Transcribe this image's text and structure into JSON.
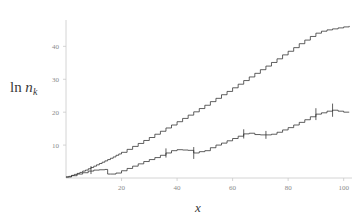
{
  "chart_data": {
    "type": "line",
    "title": "",
    "subtitle": "",
    "xlabel": "x",
    "ylabel": "ln n_k",
    "ylabel_parts": {
      "operator": "ln",
      "variable": "n",
      "subscript": "k"
    },
    "xlim": [
      0,
      103
    ],
    "ylim": [
      0,
      48
    ],
    "xticks": [
      20,
      40,
      60,
      80,
      100
    ],
    "xtick_labels": [
      "20",
      "40",
      "60",
      "80",
      "100"
    ],
    "yticks": [
      10,
      20,
      30,
      40
    ],
    "ytick_labels": [
      "10",
      "20",
      "30",
      "40"
    ],
    "grid": false,
    "legend": "none",
    "axis_color": "#c9c9c9",
    "tick_label_color": "#8a8a8a",
    "curve_color": "#2b2b2b",
    "series": [
      {
        "name": "upper-staircase",
        "style": "step",
        "x": [
          0,
          1,
          2,
          3,
          4,
          5,
          6,
          7,
          8,
          9,
          10,
          11,
          12,
          13,
          14,
          15,
          16,
          17,
          18,
          19,
          20,
          22,
          24,
          26,
          28,
          30,
          32,
          34,
          36,
          38,
          40,
          42,
          44,
          46,
          48,
          50,
          52,
          54,
          56,
          58,
          60,
          62,
          64,
          66,
          68,
          70,
          72,
          74,
          76,
          78,
          80,
          82,
          84,
          86,
          88,
          90,
          92,
          94,
          96,
          98,
          100,
          102
        ],
        "values": [
          0.3,
          0.5,
          0.8,
          1.1,
          1.4,
          1.7,
          2.1,
          2.4,
          2.8,
          3.2,
          3.6,
          4.0,
          4.4,
          4.8,
          5.2,
          5.6,
          6.0,
          6.4,
          6.9,
          7.3,
          7.8,
          8.7,
          9.6,
          10.5,
          11.4,
          12.3,
          13.3,
          14.2,
          15.2,
          16.1,
          17.1,
          18.1,
          19.1,
          20.1,
          21.1,
          22.1,
          23.2,
          24.2,
          25.3,
          26.3,
          27.4,
          28.5,
          29.6,
          30.7,
          31.8,
          32.9,
          34.0,
          35.1,
          36.2,
          37.4,
          38.5,
          39.6,
          40.8,
          41.9,
          43.0,
          44.0,
          44.6,
          45.0,
          45.3,
          45.6,
          45.9,
          46.2
        ]
      },
      {
        "name": "lower-staircase",
        "style": "step",
        "x": [
          0,
          2,
          4,
          6,
          8,
          10,
          12,
          14,
          15,
          16,
          18,
          20,
          22,
          24,
          26,
          28,
          30,
          32,
          34,
          36,
          38,
          40,
          42,
          44,
          46,
          48,
          50,
          52,
          54,
          56,
          58,
          60,
          62,
          64,
          66,
          68,
          70,
          72,
          74,
          76,
          78,
          80,
          82,
          84,
          86,
          88,
          90,
          92,
          94,
          96,
          98,
          100,
          102
        ],
        "values": [
          0.3,
          0.7,
          1.2,
          1.6,
          2.1,
          2.4,
          2.5,
          2.6,
          1.2,
          1.2,
          1.5,
          2.2,
          2.9,
          3.6,
          4.3,
          5.0,
          5.6,
          6.2,
          6.9,
          7.6,
          8.3,
          8.6,
          8.5,
          8.4,
          7.6,
          8.0,
          8.3,
          9.2,
          10.0,
          10.6,
          11.3,
          12.0,
          12.7,
          13.4,
          13.6,
          13.2,
          13.1,
          13.1,
          13.3,
          13.9,
          14.6,
          15.3,
          16.1,
          16.9,
          17.7,
          18.6,
          19.4,
          19.8,
          20.3,
          20.6,
          20.3,
          20.0,
          20.0
        ]
      }
    ],
    "error_bars": [
      {
        "x": 9,
        "y": 2.4,
        "half_height": 1.2
      },
      {
        "x": 36,
        "y": 7.6,
        "half_height": 1.4
      },
      {
        "x": 46,
        "y": 7.6,
        "half_height": 1.8
      },
      {
        "x": 64,
        "y": 13.4,
        "half_height": 1.4
      },
      {
        "x": 72,
        "y": 13.1,
        "half_height": 1.2
      },
      {
        "x": 90,
        "y": 19.4,
        "half_height": 1.8
      },
      {
        "x": 96,
        "y": 20.6,
        "half_height": 2.0
      }
    ]
  }
}
